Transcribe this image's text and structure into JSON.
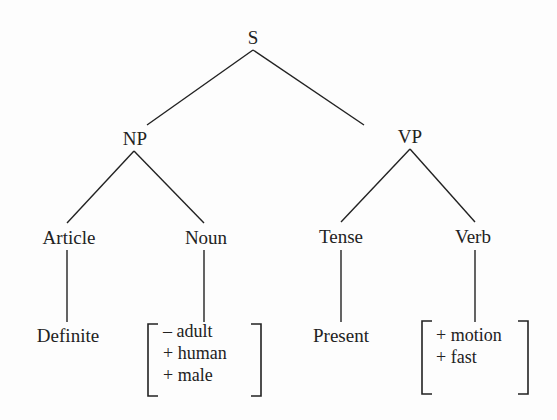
{
  "diagram": {
    "type": "syntax-tree",
    "root": {
      "label": "S",
      "children": [
        {
          "label": "NP",
          "children": [
            {
              "label": "Article",
              "children": [
                {
                  "label": "Definite"
                }
              ]
            },
            {
              "label": "Noun",
              "features": [
                "– adult",
                "+ human",
                "+ male"
              ]
            }
          ]
        },
        {
          "label": "VP",
          "children": [
            {
              "label": "Tense",
              "children": [
                {
                  "label": "Present"
                }
              ]
            },
            {
              "label": "Verb",
              "features": [
                "+ motion",
                "+ fast"
              ]
            }
          ]
        }
      ]
    }
  },
  "nodes": {
    "s": "S",
    "np": "NP",
    "vp": "VP",
    "article": "Article",
    "noun": "Noun",
    "tense": "Tense",
    "verb": "Verb",
    "definite": "Definite",
    "present": "Present"
  },
  "noun_features": [
    "– adult",
    "+ human",
    "+ male"
  ],
  "verb_features": [
    "+ motion",
    "+ fast"
  ],
  "colors": {
    "ink": "#222222",
    "background": "#fdfdfd"
  }
}
